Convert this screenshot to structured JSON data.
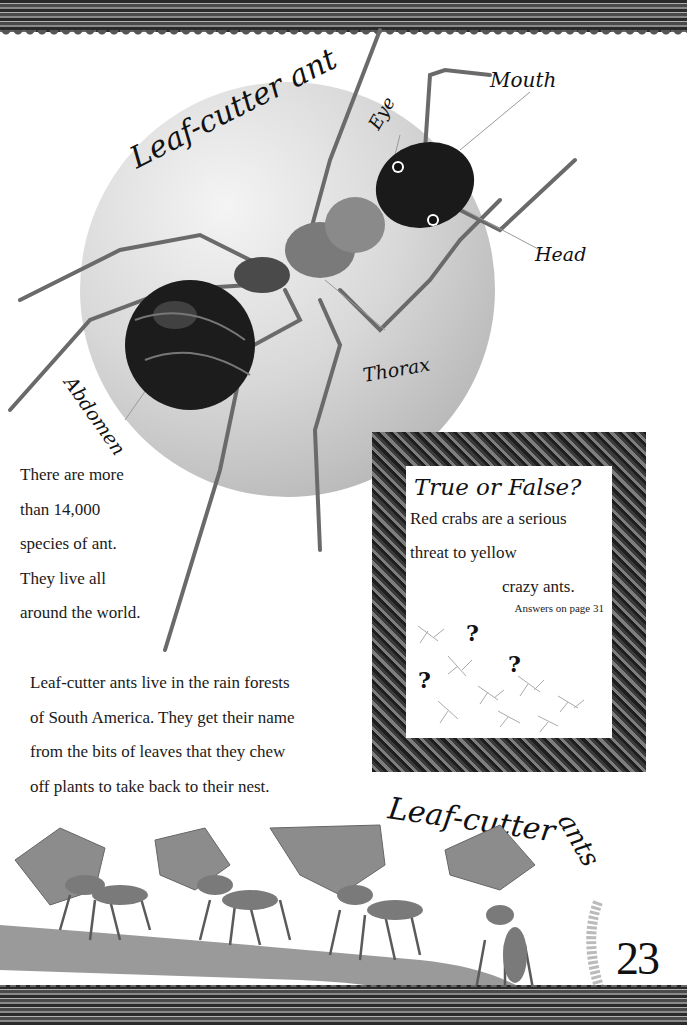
{
  "diagram": {
    "title": "Leaf-cutter ant",
    "labels": {
      "eye": "Eye",
      "mouth": "Mouth",
      "head": "Head",
      "thorax": "Thorax",
      "abdomen": "Abdomen"
    }
  },
  "fact_left": {
    "lines": [
      "There are more",
      "than 14,000",
      "species of ant.",
      "They live all",
      "around the world."
    ]
  },
  "main_paragraph": {
    "lines": [
      "Leaf-cutter ants live in the rain forests",
      "of South America. They get their name",
      "from the bits of leaves that they chew",
      "off plants to take back to their nest."
    ]
  },
  "true_or_false": {
    "title": "True or False?",
    "lines": [
      "Red crabs are a serious",
      "threat to yellow",
      "crazy ants."
    ],
    "answers_note": "Answers on page 31"
  },
  "illustration_caption": {
    "part1": "Leaf-cutter",
    "part2": "ants"
  },
  "page_number": "23",
  "colors": {
    "border": "#3a3a3a",
    "sphere": "#d0d0d0",
    "text": "#1a1a1a"
  }
}
